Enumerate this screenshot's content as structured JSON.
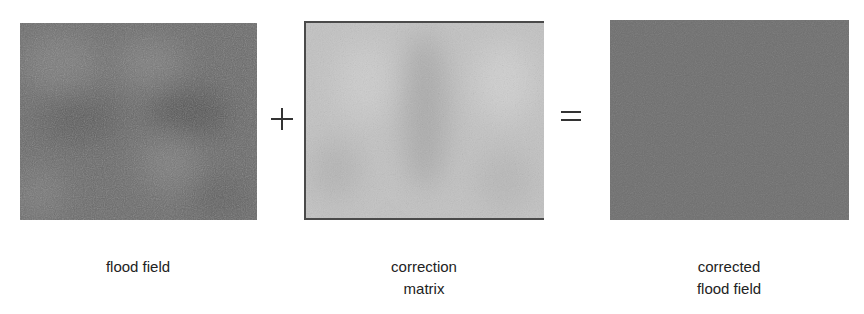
{
  "figure": {
    "panels": [
      {
        "id": "flood-field",
        "label_lines": [
          "flood field"
        ],
        "tone": "#6b6b6b",
        "noise_light": "#858585",
        "noise_dark": "#555555"
      },
      {
        "id": "correction-matrix",
        "label_lines": [
          "correction",
          "matrix"
        ],
        "tone": "#bdbdbd",
        "noise_light": "#d4d4d4",
        "noise_dark": "#a8a8a8"
      },
      {
        "id": "corrected-flood-field",
        "label_lines": [
          "corrected",
          "flood field"
        ],
        "tone": "#6e6e6e",
        "noise_light": "#7c7c7c",
        "noise_dark": "#626262"
      }
    ],
    "operators": {
      "plus": "+",
      "equals": "="
    }
  }
}
